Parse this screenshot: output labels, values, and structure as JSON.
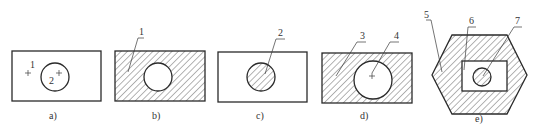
{
  "figure": {
    "panels": [
      {
        "id": "a",
        "caption": "a)",
        "labels": [
          "1",
          "2"
        ],
        "description": "Rectangle with circle, no hatching; point 1 in rectangle, point 2 in circle"
      },
      {
        "id": "b",
        "caption": "b)",
        "labels": [
          "1"
        ],
        "description": "Rectangle hatched, circle unhatched (hole)"
      },
      {
        "id": "c",
        "caption": "c)",
        "labels": [
          "2"
        ],
        "description": "Only circle hatched"
      },
      {
        "id": "d",
        "caption": "d)",
        "labels": [
          "3",
          "4"
        ],
        "description": "Rectangle hatched with larger unhatched circle"
      },
      {
        "id": "e",
        "caption": "e)",
        "labels": [
          "5",
          "6",
          "7"
        ],
        "description": "Hexagon hatched, inner rectangle unhatched, inner circle hatched"
      }
    ],
    "colors": {
      "line": "#2a2a2a",
      "background": "#ffffff",
      "text": "#333333"
    }
  }
}
